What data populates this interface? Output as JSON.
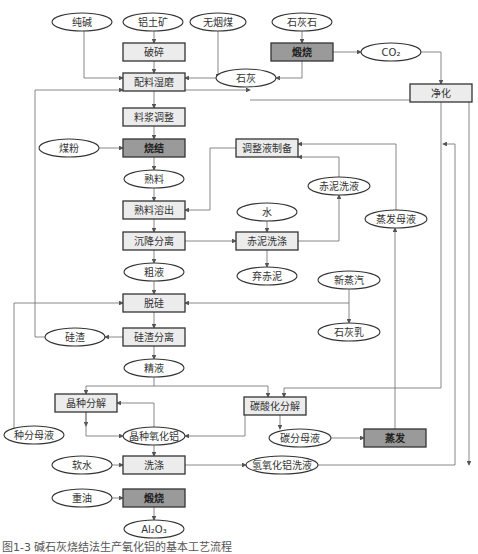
{
  "figure": {
    "caption": "图1-3  碱石灰烧结法生产氧化铝的基本工艺流程"
  },
  "colors": {
    "process_box_fill": "#ececec",
    "key_process_box_fill": "#9a9a9a",
    "stroke": "#333333",
    "edge": "#6a6a6a"
  },
  "nodes": [
    {
      "id": "chunjian",
      "label": "纯碱",
      "shape": "ellipse",
      "x": 82,
      "y": 22,
      "w": 60,
      "h": 18
    },
    {
      "id": "lvtukuang",
      "label": "铝土矿",
      "shape": "ellipse",
      "x": 153,
      "y": 22,
      "w": 60,
      "h": 18
    },
    {
      "id": "wuyanmei",
      "label": "无烟煤",
      "shape": "ellipse",
      "x": 218,
      "y": 22,
      "w": 56,
      "h": 18
    },
    {
      "id": "shihuishi",
      "label": "石灰石",
      "shape": "ellipse",
      "x": 302,
      "y": 22,
      "w": 60,
      "h": 18
    },
    {
      "id": "posui",
      "label": "破碎",
      "shape": "box",
      "x": 154,
      "y": 52,
      "w": 62,
      "h": 18
    },
    {
      "id": "duanshao1",
      "label": "煅烧",
      "shape": "box",
      "dark": true,
      "x": 302,
      "y": 52,
      "w": 62,
      "h": 18
    },
    {
      "id": "co2",
      "label": "CO₂",
      "shape": "ellipse",
      "x": 391,
      "y": 52,
      "w": 60,
      "h": 18
    },
    {
      "id": "peiliao",
      "label": "配料湿磨",
      "shape": "box",
      "x": 154,
      "y": 82,
      "w": 62,
      "h": 18
    },
    {
      "id": "shihui",
      "label": "石灰",
      "shape": "ellipse",
      "x": 246,
      "y": 78,
      "w": 60,
      "h": 18
    },
    {
      "id": "jinghua",
      "label": "净化",
      "shape": "box",
      "x": 441,
      "y": 93,
      "w": 62,
      "h": 18
    },
    {
      "id": "liaojiang",
      "label": "料浆调整",
      "shape": "box",
      "x": 154,
      "y": 117,
      "w": 62,
      "h": 18
    },
    {
      "id": "meifen",
      "label": "煤粉",
      "shape": "ellipse",
      "x": 69,
      "y": 148,
      "w": 60,
      "h": 18
    },
    {
      "id": "shaojie",
      "label": "烧结",
      "shape": "box",
      "dark": true,
      "x": 154,
      "y": 148,
      "w": 62,
      "h": 18
    },
    {
      "id": "tiaozhengye",
      "label": "调整液制备",
      "shape": "box",
      "x": 267,
      "y": 148,
      "w": 62,
      "h": 18
    },
    {
      "id": "shuliao",
      "label": "熟料",
      "shape": "ellipse",
      "x": 154,
      "y": 179,
      "w": 60,
      "h": 18
    },
    {
      "id": "chinixiye",
      "label": "赤泥洗液",
      "shape": "ellipse",
      "x": 339,
      "y": 186,
      "w": 62,
      "h": 18
    },
    {
      "id": "shuliaorongchu",
      "label": "熟料溶出",
      "shape": "box",
      "x": 154,
      "y": 210,
      "w": 62,
      "h": 18
    },
    {
      "id": "shui",
      "label": "水",
      "shape": "ellipse",
      "x": 267,
      "y": 212,
      "w": 60,
      "h": 18
    },
    {
      "id": "zhengfamuye",
      "label": "蒸发母液",
      "shape": "ellipse",
      "x": 396,
      "y": 219,
      "w": 62,
      "h": 18
    },
    {
      "id": "chenjiang",
      "label": "沉降分离",
      "shape": "box",
      "x": 154,
      "y": 241,
      "w": 62,
      "h": 18
    },
    {
      "id": "chinixidi",
      "label": "赤泥洗涤",
      "shape": "box",
      "x": 267,
      "y": 241,
      "w": 62,
      "h": 18
    },
    {
      "id": "cuye",
      "label": "粗液",
      "shape": "ellipse",
      "x": 154,
      "y": 272,
      "w": 60,
      "h": 18
    },
    {
      "id": "qichini",
      "label": "弃赤泥",
      "shape": "ellipse",
      "x": 267,
      "y": 276,
      "w": 60,
      "h": 18
    },
    {
      "id": "xinzhengqi",
      "label": "新蒸汽",
      "shape": "ellipse",
      "x": 349,
      "y": 280,
      "w": 62,
      "h": 18
    },
    {
      "id": "tuogui",
      "label": "脱硅",
      "shape": "box",
      "x": 154,
      "y": 303,
      "w": 62,
      "h": 18
    },
    {
      "id": "shihuiru",
      "label": "石灰乳",
      "shape": "ellipse",
      "x": 349,
      "y": 332,
      "w": 62,
      "h": 18
    },
    {
      "id": "guizha",
      "label": "硅渣",
      "shape": "ellipse",
      "x": 75,
      "y": 337,
      "w": 60,
      "h": 18
    },
    {
      "id": "guizhafenli",
      "label": "硅渣分离",
      "shape": "box",
      "x": 154,
      "y": 337,
      "w": 62,
      "h": 18
    },
    {
      "id": "jingye",
      "label": "精液",
      "shape": "ellipse",
      "x": 154,
      "y": 368,
      "w": 60,
      "h": 18
    },
    {
      "id": "jingzhongfenjie",
      "label": "晶种分解",
      "shape": "box",
      "x": 86,
      "y": 403,
      "w": 62,
      "h": 18
    },
    {
      "id": "tansuanhua",
      "label": "碳酸化分解",
      "shape": "box",
      "x": 275,
      "y": 406,
      "w": 62,
      "h": 18
    },
    {
      "id": "zhongfenmuye",
      "label": "种分母液",
      "shape": "ellipse",
      "x": 34,
      "y": 435,
      "w": 60,
      "h": 18
    },
    {
      "id": "jingzhongyanghualv",
      "label": "晶种氧化铝",
      "shape": "ellipse",
      "x": 154,
      "y": 436,
      "w": 62,
      "h": 18
    },
    {
      "id": "tanfenmuye",
      "label": "碳分母液",
      "shape": "ellipse",
      "x": 300,
      "y": 438,
      "w": 62,
      "h": 18
    },
    {
      "id": "zhengfa",
      "label": "蒸发",
      "shape": "box",
      "dark": true,
      "x": 395,
      "y": 438,
      "w": 62,
      "h": 18
    },
    {
      "id": "ruanshui",
      "label": "软水",
      "shape": "ellipse",
      "x": 82,
      "y": 465,
      "w": 60,
      "h": 18
    },
    {
      "id": "xidi",
      "label": "洗涤",
      "shape": "box",
      "x": 154,
      "y": 465,
      "w": 62,
      "h": 18
    },
    {
      "id": "qingyanghualvxiye",
      "label": "氢氧化铝洗液",
      "shape": "ellipse",
      "x": 282,
      "y": 465,
      "w": 72,
      "h": 18
    },
    {
      "id": "zhongyou",
      "label": "重油",
      "shape": "ellipse",
      "x": 82,
      "y": 498,
      "w": 60,
      "h": 18
    },
    {
      "id": "duanshao2",
      "label": "煅烧",
      "shape": "box",
      "dark": true,
      "x": 154,
      "y": 498,
      "w": 62,
      "h": 18
    },
    {
      "id": "al2o3",
      "label": "Al₂O₃",
      "shape": "ellipse",
      "x": 154,
      "y": 529,
      "w": 60,
      "h": 18
    }
  ],
  "edges": [
    "M154,31 L154,43",
    "M154,61 L154,73",
    "M84,31 L84,78 L123,78",
    "M218,31 L218,78",
    "M302,31 L302,43",
    "M302,61 L302,78 L276,78",
    "M216,78 L185,78",
    "M333,52 L361,52",
    "M421,52 L441,52 L441,84",
    "M154,91 L154,108",
    "M154,126 L154,139",
    "M99,148 L123,148",
    "M154,157 L154,170",
    "M154,188 L154,201",
    "M154,219 L154,232",
    "M236,148 L210,148 L210,210 L185,210",
    "M185,241 L236,241",
    "M267,221 L267,232",
    "M267,250 L267,267",
    "M298,241 L339,241 L339,195",
    "M339,177 L339,157 L298,157",
    "M154,250 L154,263",
    "M154,281 L154,294",
    "M349,289 L349,323",
    "M349,303 L185,303",
    "M154,312 L154,328",
    "M123,337 L105,337",
    "M45,337 L35,337 L35,90 L123,90",
    "M154,346 L154,359",
    "M154,377 L154,386 L86,386 L86,394",
    "M154,386 L268,386 L268,397",
    "M86,412 L86,426",
    "M86,412 L86,436 L123,436",
    "M245,406 L245,436 L185,436",
    "M154,427 L154,403 L117,403",
    "M280,415 L280,429",
    "M331,438 L364,438",
    "M395,429 L395,228",
    "M396,210 L396,144 L298,144",
    "M441,102 L441,388 L284,388 L284,397",
    "M154,445 L154,456",
    "M112,465 L123,465",
    "M185,465 L246,465",
    "M318,465 L455,465 L455,144 L443,144",
    "M112,498 L123,498",
    "M154,507 L154,520",
    "M14,435 L14,303 L123,303",
    "M250,100 L469,100 L469,465",
    "M185,90 L250,90"
  ]
}
